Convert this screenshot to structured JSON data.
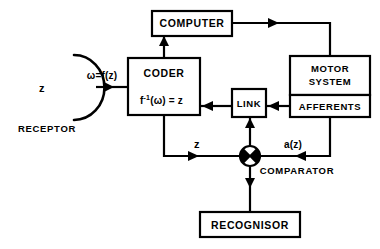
{
  "diagram": {
    "background_color": "#ffffff",
    "line_color": "#000000",
    "blocks": [
      {
        "id": "computer",
        "label": "COMPUTER"
      },
      {
        "id": "coder",
        "label": "CODER",
        "formula_f": "f",
        "formula_sup": "-1",
        "formula_rest": "(ω) = z"
      },
      {
        "id": "motor",
        "label_line1": "MOTOR",
        "label_line2": "SYSTEM"
      },
      {
        "id": "afferents",
        "label": "AFFERENTS"
      },
      {
        "id": "link",
        "label": "LINK"
      },
      {
        "id": "recognisor",
        "label": "RECOGNISOR"
      }
    ],
    "receptor": {
      "caption": "RECEPTOR",
      "input_label": "z"
    },
    "comparator": {
      "caption": "COMPARATOR"
    },
    "edge_labels": {
      "receptor_to_coder": "ω=f(z)",
      "coder_to_comparator": "z",
      "afferents_to_comparator": "a(z)"
    }
  }
}
